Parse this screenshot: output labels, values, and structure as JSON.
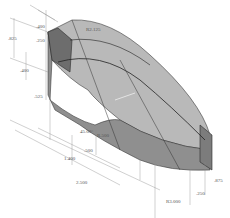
{
  "diagram": {
    "type": "isometric-technical-drawing",
    "colors": {
      "background": "#ffffff",
      "face_top": "#b8b8b8",
      "face_front": "#9a9a9a",
      "face_side": "#808080",
      "face_dark": "#6a6a6a",
      "edge": "#2a2a2a",
      "dim_line": "#777777"
    },
    "dimensions": {
      "left_height": ".825",
      "top_offset_1": ".400",
      "top_offset_2": ".250",
      "top_radius": "R2.125",
      "side_1": ".400",
      "side_2": ".525",
      "angle": "45.00°",
      "inner_radius": "R.500",
      "mid_len": ".500",
      "len_1": "1.400",
      "len_total": "2.500",
      "right_height": ".875",
      "right_small": ".250",
      "bottom_radius": "R3.000"
    }
  }
}
